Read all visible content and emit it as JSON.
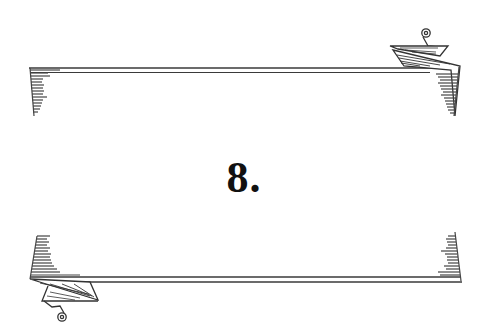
{
  "chapter": {
    "number_label": "8."
  },
  "ornament": {
    "top_banner": "scroll-banner-top",
    "bottom_banner": "scroll-banner-bottom",
    "ink_color": "#3a3a3a"
  }
}
